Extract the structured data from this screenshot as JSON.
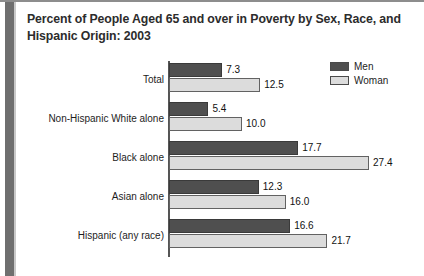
{
  "chart_data": {
    "type": "bar",
    "orientation": "horizontal",
    "title": "Percent of People Aged 65 and over in Poverty by Sex, Race, and Hispanic Origin: 2003",
    "xlabel": "",
    "ylabel": "",
    "grid": false,
    "legend_position": "top-right",
    "xlim": [
      0,
      28
    ],
    "categories": [
      "Total",
      "Non-Hispanic White alone",
      "Black alone",
      "Asian alone",
      "Hispanic (any race)"
    ],
    "series": [
      {
        "name": "Men",
        "color": "#4f4f4f",
        "values": [
          7.3,
          5.4,
          17.7,
          12.3,
          16.6
        ],
        "labels": [
          "7.3",
          "5.4",
          "17.7",
          "12.3",
          "16.6"
        ]
      },
      {
        "name": "Woman",
        "color": "#dcdcdc",
        "values": [
          12.5,
          10.0,
          27.4,
          16.0,
          21.7
        ],
        "labels": [
          "12.5",
          "10.0",
          "27.4",
          "16.0",
          "21.7"
        ]
      }
    ]
  },
  "legend": {
    "items": [
      {
        "label": "Men",
        "swatch": "legend-swatch-men"
      },
      {
        "label": "Woman",
        "swatch": "legend-swatch-woman"
      }
    ]
  }
}
